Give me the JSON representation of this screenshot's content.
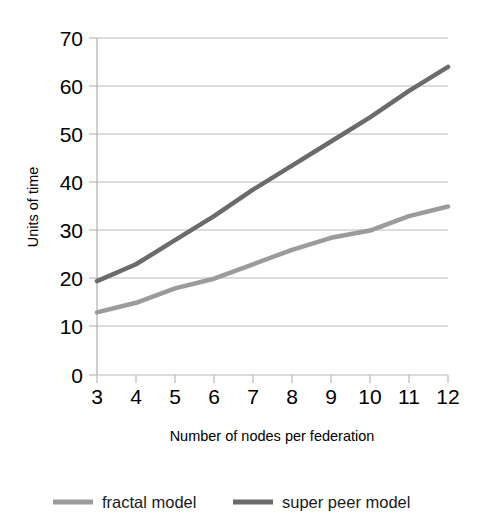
{
  "figure": {
    "clipped_caption": "",
    "background_color": "#ffffff"
  },
  "axes": {
    "x_title": "Number of nodes per federation",
    "y_title": "Units of time",
    "x_tick_labels": [
      "3",
      "4",
      "5",
      "6",
      "7",
      "8",
      "9",
      "10",
      "11",
      "12"
    ],
    "y_tick_labels": [
      "0",
      "10",
      "20",
      "30",
      "40",
      "50",
      "60",
      "70"
    ]
  },
  "legend": {
    "entries": [
      {
        "label": "fractal model",
        "color": "#9b9b9b",
        "swatch_name": "legend-swatch-fractal"
      },
      {
        "label": "super peer model",
        "color": "#6b6b6b",
        "swatch_name": "legend-swatch-super-peer"
      }
    ]
  },
  "chart_data": {
    "type": "line",
    "title": "",
    "xlabel": "Number of nodes per federation",
    "ylabel": "Units of time",
    "x": [
      3,
      4,
      5,
      6,
      7,
      8,
      9,
      10,
      11,
      12
    ],
    "xlim": [
      3,
      12
    ],
    "ylim": [
      0,
      70
    ],
    "y_ticks": [
      0,
      10,
      20,
      30,
      40,
      50,
      60,
      70
    ],
    "x_ticks": [
      3,
      4,
      5,
      6,
      7,
      8,
      9,
      10,
      11,
      12
    ],
    "grid": "horizontal",
    "legend_position": "bottom",
    "series": [
      {
        "name": "fractal model",
        "color": "#9b9b9b",
        "line_width": 4.5,
        "values": [
          13,
          15,
          18,
          20,
          23,
          26,
          28.5,
          30,
          33,
          35
        ]
      },
      {
        "name": "super peer model",
        "color": "#6b6b6b",
        "line_width": 4.5,
        "values": [
          19.5,
          23,
          28,
          33,
          38.5,
          43.5,
          48.5,
          53.5,
          59,
          64
        ]
      }
    ]
  }
}
